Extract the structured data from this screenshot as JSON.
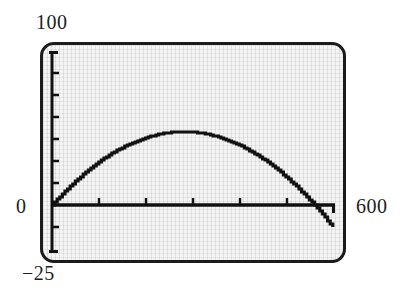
{
  "figure": {
    "kind": "graphing-calculator-screen",
    "screen_background": "#f4f4f4",
    "trace_color": "#111111",
    "bezel_color": "#1b1b1b"
  },
  "labels": {
    "y_max": "100",
    "y_zero": "0",
    "y_min": "−25",
    "x_max": "600"
  },
  "chart_data": {
    "type": "line",
    "title": "",
    "xlabel": "",
    "ylabel": "",
    "xlim": [
      0,
      600
    ],
    "ylim": [
      -25,
      100
    ],
    "grid": true,
    "legend": null,
    "x_tick_labels": [
      "0",
      "600"
    ],
    "y_tick_labels": [
      "100",
      "0",
      "−25"
    ],
    "x_ticks": [
      100,
      200,
      300,
      400,
      500
    ],
    "y_ticks": [
      -25,
      -12.5,
      12.5,
      25,
      37.5,
      50,
      62.5,
      75,
      87.5,
      100
    ],
    "x_tick_step": 100,
    "y_tick_step": 12.5,
    "axes_drawn": [
      "x-axis at y=0",
      "y-axis at x=0"
    ],
    "series": [
      {
        "name": "parabola",
        "description": "downward-opening parabola, roots near x=0 and x=560, vertex near x=280",
        "x": [
          0,
          20,
          40,
          60,
          80,
          100,
          120,
          140,
          160,
          180,
          200,
          220,
          240,
          260,
          280,
          300,
          320,
          340,
          360,
          380,
          400,
          420,
          440,
          460,
          480,
          500,
          520,
          540,
          560,
          580,
          600
        ],
        "y": [
          0,
          5.4,
          10.6,
          15.4,
          20.0,
          24.3,
          28.3,
          32.0,
          35.4,
          38.6,
          41.4,
          44.0,
          46.3,
          47.4,
          48.0,
          47.4,
          46.3,
          44.0,
          41.4,
          38.6,
          35.4,
          32.0,
          28.3,
          24.3,
          20.0,
          15.4,
          10.6,
          5.4,
          0.0,
          -5.8,
          -11.9
        ]
      }
    ]
  }
}
